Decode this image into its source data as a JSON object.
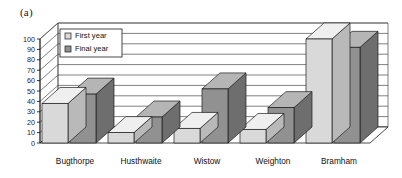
{
  "figure": {
    "label": "(a)"
  },
  "chart_data": {
    "type": "bar",
    "title": "",
    "subtitle": "",
    "xlabel": "",
    "ylabel": "",
    "ylim": [
      0,
      100
    ],
    "ytick_step": 10,
    "yticks": [
      "0",
      "10",
      "20",
      "30",
      "40",
      "50",
      "60",
      "70",
      "80",
      "90",
      "100"
    ],
    "grid": true,
    "three_d": true,
    "legend_position": "top-left-inside",
    "categories": [
      "Bugthorpe",
      "Husthwaite",
      "Wistow",
      "Weighton",
      "Bramham"
    ],
    "series": [
      {
        "name": "First year",
        "color": "#d9d9d9",
        "values": [
          38,
          10,
          14,
          13,
          100
        ]
      },
      {
        "name": "Final year",
        "color": "#919191",
        "values": [
          47,
          25,
          52,
          34,
          92
        ]
      }
    ]
  },
  "legend": {
    "items": [
      {
        "label": "First year",
        "swatch": "#d9d9d9"
      },
      {
        "label": "Final year",
        "swatch": "#919191"
      }
    ]
  },
  "colors": {
    "axis": "#1c1c1c",
    "gridline": "#4a4a4a",
    "plot_background": "#ffffff",
    "bar_first_front": "#d9d9d9",
    "bar_first_top": "#efefef",
    "bar_first_side": "#b9b9b9",
    "bar_final_front": "#919191",
    "bar_final_top": "#b5b5b5",
    "bar_final_side": "#6e6e6e",
    "bar_outline": "#1c1c1c"
  }
}
